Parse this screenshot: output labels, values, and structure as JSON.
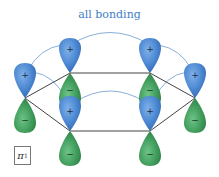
{
  "title": "all bonding",
  "orbital_label": {
    "symbol": "π",
    "subscript": "1"
  },
  "colors": {
    "positive_lobe": "#4a86d0",
    "negative_lobe": "#3f9a5a",
    "overlap_arc": "#8ab0d8",
    "bond_line": "#444444",
    "title_text": "#3f7fc6"
  },
  "signs": {
    "positive": "+",
    "negative": "−"
  },
  "atoms": [
    {
      "id": "C1",
      "x": 25,
      "y": 98,
      "top_phase": "+",
      "bottom_phase": "−"
    },
    {
      "id": "C2",
      "x": 70,
      "y": 73,
      "top_phase": "+",
      "bottom_phase": "−"
    },
    {
      "id": "C3",
      "x": 150,
      "y": 73,
      "top_phase": "+",
      "bottom_phase": "−"
    },
    {
      "id": "C4",
      "x": 195,
      "y": 98,
      "top_phase": "+",
      "bottom_phase": "−"
    },
    {
      "id": "C5",
      "x": 150,
      "y": 131,
      "top_phase": "+",
      "bottom_phase": "−"
    },
    {
      "id": "C6",
      "x": 70,
      "y": 131,
      "top_phase": "+",
      "bottom_phase": "−"
    }
  ]
}
